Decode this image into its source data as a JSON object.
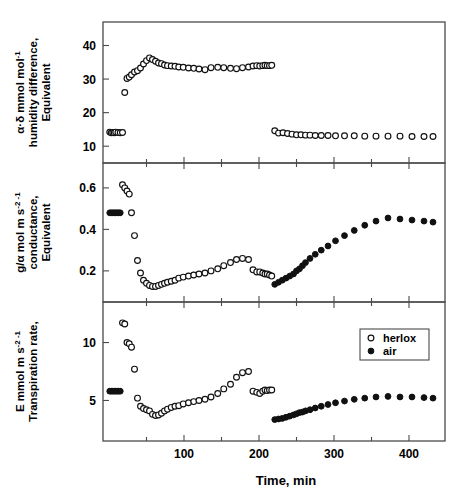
{
  "figure": {
    "xlabel": "Time,  min",
    "x_ticks": [
      "100",
      "200",
      "300",
      "400"
    ],
    "x_tick_values": [
      100,
      200,
      300,
      400
    ],
    "xlim": [
      -8,
      448
    ],
    "legend": {
      "position": "bottom-panel-upper-right",
      "entries": [
        {
          "label": "herlox",
          "marker": "open-circle"
        },
        {
          "label": "air",
          "marker": "filled-circle"
        }
      ]
    }
  },
  "panels": [
    {
      "id": "humidity",
      "ylabel_lines": [
        "Equivalent",
        "humidity difference,",
        "α·δ  mmol  mol"
      ],
      "ylabel_sup": "-1",
      "y_ticks": [
        "40",
        "30",
        "20",
        "10"
      ],
      "y_tick_values": [
        40,
        30,
        20,
        10
      ],
      "ylim": [
        5,
        47
      ]
    },
    {
      "id": "conductance",
      "ylabel_lines": [
        "Equivalent",
        "conductance,",
        "g/α  mol  m   s"
      ],
      "ylabel_sup": "-2      -1",
      "y_ticks": [
        "0.6",
        "0.4",
        "0.2"
      ],
      "y_tick_values": [
        0.6,
        0.4,
        0.2
      ],
      "ylim": [
        0.05,
        0.72
      ]
    },
    {
      "id": "transpiration",
      "ylabel_lines": [
        "Transpiration rate,",
        "E mmol  m   s"
      ],
      "ylabel_sup": "-2    -1",
      "y_ticks": [
        "10",
        "5"
      ],
      "y_tick_values": [
        10,
        5
      ],
      "ylim": [
        1.5,
        13.5
      ]
    }
  ],
  "chart_data": {
    "type": "scatter",
    "title": "",
    "xlabel": "Time, min",
    "grid": false,
    "legend_position": "bottom panel, upper right",
    "subplots": [
      {
        "name": "humidity",
        "ylabel": "Equivalent humidity difference, α·δ mmol mol-1",
        "ylim": [
          5,
          47
        ],
        "xlim": [
          -8,
          448
        ],
        "series": [
          {
            "name": "herlox",
            "marker": "open-circle",
            "x": [
              1,
              3,
              5,
              7,
              9,
              12,
              15,
              18,
              21,
              24,
              27,
              30,
              34,
              38,
              42,
              46,
              50,
              54,
              58,
              62,
              66,
              70,
              74,
              78,
              83,
              88,
              93,
              99,
              106,
              113,
              120,
              128,
              136,
              145,
              153,
              162,
              170,
              178,
              186,
              192,
              197,
              201,
              205,
              208,
              211,
              214,
              217,
              221,
              226,
              232,
              238,
              244,
              250,
              256,
              262,
              268,
              275,
              283,
              292,
              302,
              314,
              327,
              341,
              356,
              372,
              388,
              404,
              420,
              432
            ],
            "y": [
              14.2,
              14.0,
              14.1,
              14.0,
              14.2,
              14.1,
              14.0,
              14.1,
              26.0,
              30.2,
              30.6,
              31.3,
              32.1,
              32.5,
              33.3,
              34.5,
              35.5,
              36.3,
              35.8,
              35.3,
              34.8,
              34.6,
              34.2,
              34.0,
              33.9,
              33.8,
              33.6,
              33.5,
              33.3,
              33.2,
              33.0,
              32.8,
              33.4,
              33.5,
              33.4,
              33.2,
              33.1,
              33.4,
              33.6,
              33.9,
              34.0,
              33.9,
              34.0,
              34.1,
              34.0,
              34.0,
              34.1,
              14.6,
              13.9,
              14.0,
              13.8,
              13.6,
              13.4,
              13.4,
              13.3,
              13.3,
              13.2,
              13.2,
              13.2,
              13.1,
              13.1,
              13.1,
              13.0,
              13.0,
              13.0,
              13.0,
              12.9,
              12.9,
              12.9
            ]
          }
        ]
      },
      {
        "name": "conductance",
        "ylabel": "Equivalent conductance, g/α mol m-2 s-1",
        "ylim": [
          0.05,
          0.72
        ],
        "xlim": [
          -8,
          448
        ],
        "series": [
          {
            "name": "air",
            "marker": "filled-circle",
            "x": [
              1,
              3,
              5,
              7,
              9,
              11,
              13,
              15,
              221,
              226,
              231,
              236,
              241,
              246,
              250,
              254,
              258,
              262,
              268,
              275,
              283,
              292,
              302,
              314,
              327,
              341,
              356,
              372,
              388,
              404,
              420,
              432
            ],
            "y": [
              0.48,
              0.48,
              0.48,
              0.48,
              0.48,
              0.48,
              0.48,
              0.48,
              0.135,
              0.145,
              0.155,
              0.165,
              0.175,
              0.185,
              0.2,
              0.21,
              0.225,
              0.24,
              0.26,
              0.28,
              0.3,
              0.32,
              0.345,
              0.37,
              0.395,
              0.42,
              0.44,
              0.455,
              0.45,
              0.445,
              0.44,
              0.435
            ]
          },
          {
            "name": "herlox",
            "marker": "open-circle",
            "x": [
              18,
              21,
              24,
              27,
              30,
              34,
              38,
              42,
              46,
              50,
              54,
              58,
              62,
              66,
              70,
              74,
              78,
              83,
              88,
              93,
              99,
              106,
              113,
              120,
              128,
              136,
              145,
              153,
              162,
              170,
              178,
              186,
              192,
              197,
              201,
              205,
              208,
              211,
              214,
              217
            ],
            "y": [
              0.615,
              0.6,
              0.585,
              0.57,
              0.48,
              0.37,
              0.25,
              0.19,
              0.155,
              0.14,
              0.13,
              0.125,
              0.125,
              0.13,
              0.135,
              0.14,
              0.145,
              0.15,
              0.155,
              0.165,
              0.17,
              0.175,
              0.18,
              0.185,
              0.19,
              0.2,
              0.21,
              0.225,
              0.24,
              0.255,
              0.26,
              0.255,
              0.205,
              0.195,
              0.195,
              0.19,
              0.185,
              0.185,
              0.18,
              0.175
            ]
          }
        ]
      },
      {
        "name": "transpiration",
        "ylabel": "Transpiration rate, E mmol m-2 s-1",
        "ylim": [
          1.5,
          13.5
        ],
        "xlim": [
          -8,
          448
        ],
        "series": [
          {
            "name": "air",
            "marker": "filled-circle",
            "x": [
              1,
              3,
              5,
              7,
              9,
              11,
              13,
              15,
              221,
              226,
              231,
              236,
              241,
              246,
              250,
              254,
              258,
              262,
              268,
              275,
              283,
              292,
              302,
              314,
              327,
              341,
              356,
              372,
              388,
              404,
              420,
              432
            ],
            "y": [
              5.8,
              5.8,
              5.8,
              5.8,
              5.8,
              5.8,
              5.8,
              5.8,
              3.35,
              3.4,
              3.45,
              3.55,
              3.65,
              3.75,
              3.85,
              3.95,
              4.0,
              4.1,
              4.2,
              4.35,
              4.5,
              4.65,
              4.8,
              4.95,
              5.1,
              5.2,
              5.3,
              5.35,
              5.3,
              5.3,
              5.25,
              5.2
            ]
          },
          {
            "name": "herlox",
            "marker": "open-circle",
            "x": [
              18,
              21,
              24,
              27,
              30,
              34,
              38,
              42,
              46,
              50,
              54,
              58,
              62,
              66,
              70,
              74,
              78,
              83,
              88,
              93,
              99,
              106,
              113,
              120,
              128,
              136,
              145,
              153,
              162,
              170,
              178,
              186,
              192,
              197,
              201,
              205,
              208,
              211,
              214,
              217
            ],
            "y": [
              11.7,
              11.6,
              10.0,
              9.9,
              9.6,
              7.7,
              5.2,
              4.5,
              4.3,
              4.2,
              4.1,
              3.8,
              3.7,
              3.75,
              3.9,
              4.1,
              4.25,
              4.4,
              4.5,
              4.55,
              4.7,
              4.8,
              4.9,
              5.0,
              5.1,
              5.3,
              5.6,
              6.0,
              6.4,
              7.0,
              7.4,
              7.5,
              5.8,
              5.7,
              5.6,
              5.8,
              5.9,
              5.85,
              5.9,
              5.9
            ]
          }
        ]
      }
    ]
  }
}
